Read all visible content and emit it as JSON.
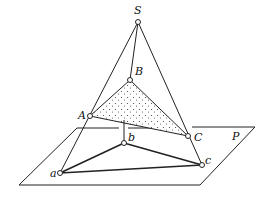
{
  "diagram": {
    "title": "",
    "labels": {
      "S": "S",
      "B": "B",
      "A": "A",
      "C": "C",
      "b": "b",
      "a": "a",
      "c": "c",
      "P": "P"
    },
    "points": {
      "S": [
        138,
        22
      ],
      "B": [
        130,
        80
      ],
      "A": [
        90,
        116
      ],
      "C": [
        188,
        136
      ],
      "a": [
        60,
        173
      ],
      "b": [
        124,
        143
      ],
      "c": [
        202,
        165
      ]
    },
    "plane": {
      "name": "P",
      "corners": [
        [
          77,
          128
        ],
        [
          255,
          127
        ],
        [
          200,
          185
        ],
        [
          19,
          185
        ]
      ]
    },
    "colors": {
      "line": "#222222",
      "shade": "#e6e6e6",
      "background": "#ffffff"
    }
  }
}
